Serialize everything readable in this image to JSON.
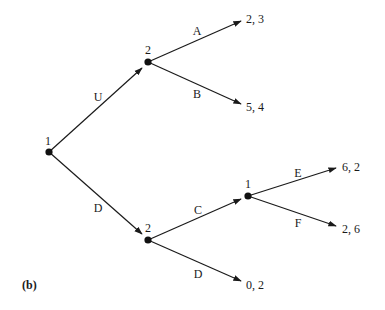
{
  "figure": {
    "panel_label": "(b)",
    "type": "extensive-form game tree"
  },
  "nodes": [
    {
      "id": "root",
      "player": "1",
      "x": 49,
      "y": 152,
      "lx": 48,
      "ly": 145
    },
    {
      "id": "n2u",
      "player": "2",
      "x": 148,
      "y": 62,
      "lx": 148,
      "ly": 54
    },
    {
      "id": "n2d",
      "player": "2",
      "x": 148,
      "y": 240,
      "lx": 148,
      "ly": 232
    },
    {
      "id": "n1d",
      "player": "1",
      "x": 248,
      "y": 196,
      "lx": 248,
      "ly": 188
    }
  ],
  "edges": [
    {
      "action": "U",
      "x1": 49,
      "y1": 152,
      "x2": 142,
      "y2": 68,
      "lx": 98,
      "ly": 101
    },
    {
      "action": "D",
      "x1": 49,
      "y1": 152,
      "x2": 142,
      "y2": 234,
      "lx": 98,
      "ly": 212
    },
    {
      "action": "A",
      "x1": 148,
      "y1": 62,
      "x2": 241,
      "y2": 21,
      "lx": 197,
      "ly": 35
    },
    {
      "action": "B",
      "x1": 148,
      "y1": 62,
      "x2": 241,
      "y2": 104,
      "lx": 197,
      "ly": 98
    },
    {
      "action": "C",
      "x1": 148,
      "y1": 240,
      "x2": 241,
      "y2": 199,
      "lx": 198,
      "ly": 214
    },
    {
      "action": "D",
      "x1": 148,
      "y1": 240,
      "x2": 241,
      "y2": 281,
      "lx": 198,
      "ly": 278
    },
    {
      "action": "E",
      "x1": 248,
      "y1": 196,
      "x2": 336,
      "y2": 168,
      "lx": 298,
      "ly": 177
    },
    {
      "action": "F",
      "x1": 248,
      "y1": 196,
      "x2": 336,
      "y2": 226,
      "lx": 298,
      "ly": 227
    }
  ],
  "payoffs": [
    {
      "text": "2, 3",
      "x": 246,
      "y": 23
    },
    {
      "text": "5, 4",
      "x": 246,
      "y": 111
    },
    {
      "text": "6, 2",
      "x": 342,
      "y": 171
    },
    {
      "text": "2, 6",
      "x": 342,
      "y": 233
    },
    {
      "text": "0, 2",
      "x": 246,
      "y": 289
    }
  ]
}
